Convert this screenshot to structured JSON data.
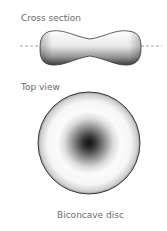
{
  "diagram": {
    "cross_section": {
      "label": "Cross section"
    },
    "top_view": {
      "label": "Top view"
    },
    "caption": "Biconcave disc"
  },
  "colors": {
    "outline": "#3a3a3a",
    "dash": "#a0a0a0",
    "label": "#6b6b6b",
    "center_dark": "#1a1a1a"
  }
}
